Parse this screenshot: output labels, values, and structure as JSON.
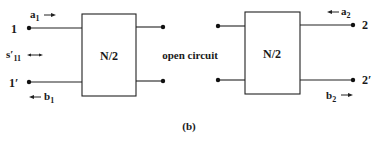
{
  "diagram": {
    "caption": "(b)",
    "middle_label": "open circuit",
    "left_network": {
      "label": "N/2",
      "port_top_label": "1",
      "port_bottom_label": "1′",
      "incident_wave": {
        "symbol": "a",
        "sub": "1",
        "arrow": "right"
      },
      "reflected_wave": {
        "symbol": "b",
        "sub": "1",
        "arrow": "left"
      },
      "param": {
        "symbol": "s′",
        "sub": "11",
        "arrow": "double"
      }
    },
    "right_network": {
      "label": "N/2",
      "port_top_label": "2",
      "port_bottom_label": "2′",
      "incident_wave": {
        "symbol": "a",
        "sub": "2",
        "arrow": "left"
      },
      "reflected_wave": {
        "symbol": "b",
        "sub": "2",
        "arrow": "right"
      }
    }
  }
}
